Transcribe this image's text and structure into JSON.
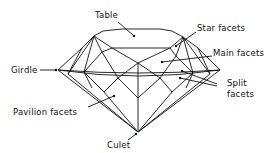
{
  "diagram": {
    "labels": {
      "table": "Table",
      "star_facets": "Star facets",
      "main_facets": "Main facets",
      "girdle": "Girdle",
      "split_facets_line1": "Split",
      "split_facets_line2": "facets",
      "pavilion_facets": "Pavilion facets",
      "culet": "Culet"
    },
    "colors": {
      "line": "#111111",
      "background": "#ffffff"
    }
  }
}
